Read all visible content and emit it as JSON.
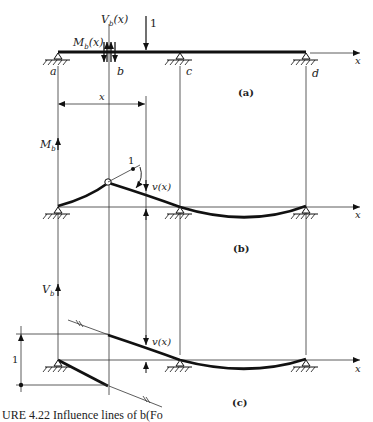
{
  "figure": {
    "panels": [
      {
        "id": "a",
        "label": "(a)"
      },
      {
        "id": "b",
        "label": "(b)"
      },
      {
        "id": "c",
        "label": "(c)"
      }
    ],
    "beam_points": {
      "a": "a",
      "b": "b",
      "c": "c",
      "d": "d"
    },
    "labels": {
      "shear": "V",
      "shear_sub": "b",
      "shear_arg": "(x)",
      "moment": "M",
      "moment_sub": "b",
      "moment_arg": "(x)",
      "unit_load": "1",
      "x_axis": "x",
      "x_dim": "x",
      "deflection": "v(x)",
      "mb_axis": "M",
      "mb_axis_sub": "b",
      "vb_axis": "V",
      "vb_axis_sub": "b",
      "unit_rotation": "1",
      "unit_jump": "1"
    },
    "caption": "URE 4.22 Influence lines of b(Fo"
  }
}
